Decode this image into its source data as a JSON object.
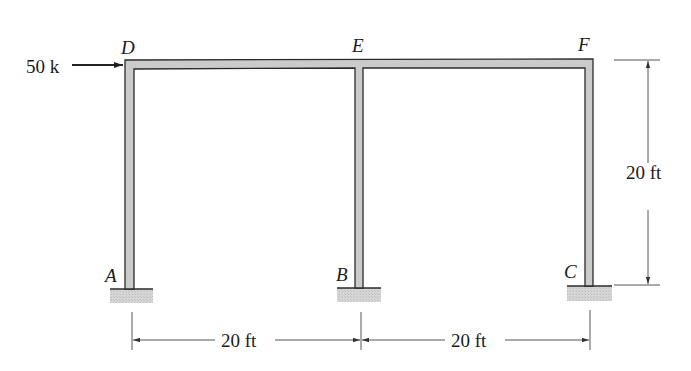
{
  "diagram": {
    "type": "portal-frame",
    "nodes": {
      "A": "A",
      "B": "B",
      "C": "C",
      "D": "D",
      "E": "E",
      "F": "F"
    },
    "load": {
      "label": "50 k",
      "node": "D",
      "direction": "right"
    },
    "dimensions": {
      "span_AB": "20 ft",
      "span_BC": "20 ft",
      "height": "20 ft"
    },
    "supports": [
      "A",
      "B",
      "C"
    ],
    "support_type": "fixed",
    "colors": {
      "member_fill": "#c8c8c8",
      "member_edge": "#2a2a2a",
      "support_fill": "#d4d4d4",
      "dim_line": "#333333"
    }
  }
}
